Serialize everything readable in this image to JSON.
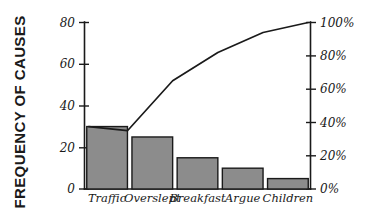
{
  "chart_data": {
    "type": "bar",
    "title": "",
    "subtitle": "",
    "xlabel": "",
    "ylabel": "FREQUENCY OF CAUSES",
    "y2label": "",
    "categories": [
      "Traffic",
      "Overslept",
      "Breakfast",
      "Argue",
      "Children"
    ],
    "values": [
      30,
      25,
      15,
      10,
      5
    ],
    "ylim": [
      0,
      80
    ],
    "yticks": [
      0,
      20,
      40,
      60,
      80
    ],
    "ytick_labels": [
      "0",
      "20",
      "40",
      "60",
      "80"
    ],
    "y2lim": [
      0,
      100
    ],
    "y2ticks": [
      0,
      20,
      40,
      60,
      80,
      100
    ],
    "y2tick_labels": [
      "0%",
      "20%",
      "40%",
      "60%",
      "80%",
      "100%"
    ],
    "grid": false,
    "legend": false,
    "series": [
      {
        "name": "Frequency of causes",
        "kind": "bar",
        "axis": "left",
        "values": [
          30,
          25,
          15,
          10,
          5
        ]
      },
      {
        "name": "Cumulative percentage",
        "kind": "line",
        "axis": "right",
        "values": [
          35,
          65,
          82,
          94,
          100
        ]
      }
    ],
    "annotations": []
  },
  "colors": {
    "bar_fill": "#8c8c8c",
    "bar_stroke": "#1a1a1a",
    "line": "#1a1a1a",
    "axis": "#1a1a1a",
    "background": "#ffffff",
    "text": "#1a1a1a"
  },
  "axes": {
    "left_title": "FREQUENCY OF CAUSES"
  }
}
